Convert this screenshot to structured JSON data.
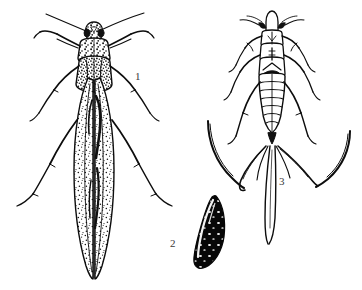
{
  "plate": {
    "title": "Thrips life stages",
    "background_color": "#ffffff",
    "ink_color": "#0d0d0d",
    "label_color": "#3a3a3a",
    "width": 362,
    "height": 290,
    "style": "black-and-white engraved line illustration"
  },
  "figures": [
    {
      "id": "figure-1",
      "label": "1",
      "name": "adult-thrips",
      "description": "Dorsal view of winged adult thrips with long fringed wings folded over abdomen, two antennae, six legs",
      "label_position": {
        "x": 135,
        "y": 71
      }
    },
    {
      "id": "figure-2",
      "label": "2",
      "name": "thrips-egg",
      "description": "Dark curved bean-shaped egg with pale speckled highlights",
      "label_position": {
        "x": 170,
        "y": 238
      }
    },
    {
      "id": "figure-3",
      "label": "3",
      "name": "thrips-nymph",
      "description": "Dorsal view of wingless nymph with segmented abdomen and long curved caudal bristles",
      "label_position": {
        "x": 279,
        "y": 176
      }
    }
  ]
}
